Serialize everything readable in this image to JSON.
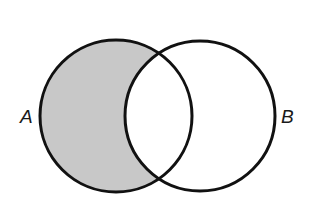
{
  "figure": {
    "width": 317,
    "height": 201,
    "background_color": "#ffffff"
  },
  "caption": {
    "prefix": "A:",
    "spacer": "  ",
    "word_all": "All",
    "term_left": "A",
    "word_is": "is",
    "term_right": "B",
    "period": ".",
    "full_text": "A:  All A is B.",
    "color": "#1a1a1a"
  },
  "diagram": {
    "type": "venn",
    "stroke_color": "#111111",
    "stroke_width": 3,
    "fill_empty": "#ffffff",
    "fill_shaded": "#c8c8c8",
    "circles": [
      {
        "name": "circle-a",
        "label": "A",
        "cx": 116,
        "cy": 116,
        "r": 76,
        "shaded_region": "exclusive"
      },
      {
        "name": "circle-b",
        "label": "B",
        "cx": 200,
        "cy": 116,
        "r": 75,
        "shaded_region": "none"
      }
    ],
    "regions": [
      {
        "name": "a-only",
        "fill": "#c8c8c8",
        "shaded": true
      },
      {
        "name": "a-and-b",
        "fill": "#ffffff",
        "shaded": false
      },
      {
        "name": "b-only",
        "fill": "#ffffff",
        "shaded": false
      }
    ]
  },
  "labels": {
    "left": "A",
    "right": "B"
  }
}
